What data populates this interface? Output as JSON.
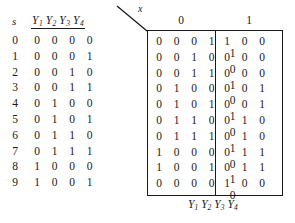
{
  "figure": {
    "left_table": {
      "header_state": "s",
      "header_outputs": "Y1 Y2 Y3 Y4",
      "output_vars": [
        "Y",
        "Y",
        "Y",
        "Y"
      ],
      "output_subs": [
        "1",
        "2",
        "3",
        "4"
      ],
      "rows": [
        {
          "s": "0",
          "bits": [
            "0",
            "0",
            "0",
            "0"
          ]
        },
        {
          "s": "1",
          "bits": [
            "0",
            "0",
            "0",
            "1"
          ]
        },
        {
          "s": "2",
          "bits": [
            "0",
            "0",
            "1",
            "0"
          ]
        },
        {
          "s": "3",
          "bits": [
            "0",
            "0",
            "1",
            "1"
          ]
        },
        {
          "s": "4",
          "bits": [
            "0",
            "1",
            "0",
            "0"
          ]
        },
        {
          "s": "5",
          "bits": [
            "0",
            "1",
            "0",
            "1"
          ]
        },
        {
          "s": "6",
          "bits": [
            "0",
            "1",
            "1",
            "0"
          ]
        },
        {
          "s": "7",
          "bits": [
            "0",
            "1",
            "1",
            "1"
          ]
        },
        {
          "s": "8",
          "bits": [
            "1",
            "0",
            "0",
            "0"
          ]
        },
        {
          "s": "9",
          "bits": [
            "1",
            "0",
            "0",
            "1"
          ]
        }
      ]
    },
    "input_axis_label": "x",
    "input_headers": [
      "0",
      "1"
    ],
    "next_state_box": {
      "col0": [
        [
          "0",
          "0",
          "0",
          "1"
        ],
        [
          "0",
          "0",
          "1",
          "0"
        ],
        [
          "0",
          "0",
          "1",
          "1"
        ],
        [
          "0",
          "1",
          "0",
          "0"
        ],
        [
          "0",
          "1",
          "0",
          "1"
        ],
        [
          "0",
          "1",
          "1",
          "0"
        ],
        [
          "0",
          "1",
          "1",
          "1"
        ],
        [
          "1",
          "0",
          "0",
          "0"
        ],
        [
          "1",
          "0",
          "0",
          "1"
        ],
        [
          "0",
          "0",
          "0",
          "0"
        ]
      ],
      "col1": [
        [
          "1",
          "0",
          "0",
          "1"
        ],
        [
          "0",
          "0",
          "0",
          "0"
        ],
        [
          "0",
          "0",
          "0",
          "1"
        ],
        [
          "0",
          "0",
          "1",
          "0"
        ],
        [
          "0",
          "0",
          "1",
          "1"
        ],
        [
          "0",
          "1",
          "0",
          "0"
        ],
        [
          "0",
          "1",
          "0",
          "1"
        ],
        [
          "0",
          "1",
          "1",
          "0"
        ],
        [
          "0",
          "1",
          "1",
          "1"
        ],
        [
          "1",
          "0",
          "0",
          "0"
        ]
      ]
    },
    "bottom_label": "Y1 Y2 Y3 Y4",
    "bottom_vars": [
      "Y",
      "Y",
      "Y",
      "Y"
    ],
    "bottom_subs": [
      "1",
      "2",
      "3",
      "4"
    ],
    "colors": {
      "ink": "#1a1a1a",
      "paper": "#ffffff"
    }
  }
}
